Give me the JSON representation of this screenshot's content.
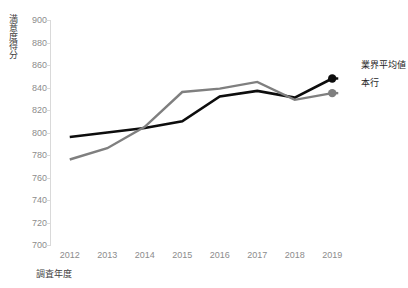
{
  "chart_data": {
    "type": "line",
    "title": "",
    "xlabel": "調査年度",
    "ylabel": "満意度得分",
    "categories": [
      "2012",
      "2013",
      "2014",
      "2015",
      "2016",
      "2017",
      "2018",
      "2019"
    ],
    "series": [
      {
        "name": "業界平均値",
        "color": "#0d0d0d",
        "values": [
          796,
          800,
          804,
          810,
          832,
          837,
          831,
          848
        ],
        "marker_last": true
      },
      {
        "name": "本行",
        "color": "#7f7f7f",
        "values": [
          776,
          786,
          805,
          836,
          839,
          845,
          829,
          835
        ],
        "marker_last": true
      }
    ],
    "ylim": [
      700,
      900
    ],
    "ytick_step": 20,
    "yticks": [
      "900",
      "880",
      "860",
      "840",
      "820",
      "800",
      "780",
      "760",
      "740",
      "720",
      "700"
    ],
    "grid": false,
    "legend_position": "right"
  },
  "axes": {
    "y_title": "満意度得分",
    "x_title": "調査年度",
    "axis_color": "#d9d9d9",
    "tick_label_color": "#8c8c8c"
  },
  "legend": {
    "items": [
      {
        "label": "業界平均値",
        "color": "#0d0d0d"
      },
      {
        "label": "本行",
        "color": "#7f7f7f"
      }
    ]
  }
}
